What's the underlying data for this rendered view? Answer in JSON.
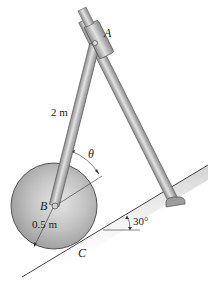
{
  "diagram": {
    "labels": {
      "point_a": "A",
      "point_b": "B",
      "point_c": "C",
      "rod_length": "2 m",
      "disk_radius": "0.5 m",
      "angle_theta": "θ",
      "incline_angle": "30°"
    },
    "colors": {
      "metal_light": "#e4e4e4",
      "metal_mid": "#b8b8b8",
      "metal_dark": "#7a7a7a",
      "outline": "#333333",
      "disk_base": "#b9b9b9"
    }
  }
}
